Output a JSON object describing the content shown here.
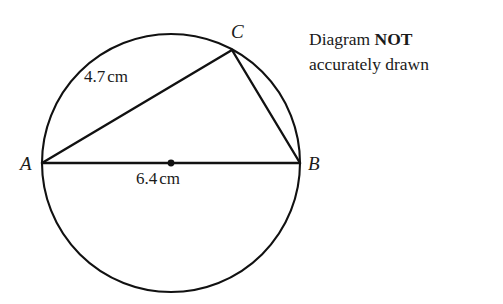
{
  "figure": {
    "background_color": "#ffffff",
    "stroke_color": "#111111",
    "circle": {
      "center_x": 171,
      "center_y": 163,
      "radius": 129,
      "centre_dot_radius": 3.4
    },
    "points": {
      "A": {
        "label": "A",
        "x": 42,
        "y": 163
      },
      "B": {
        "label": "B",
        "x": 300,
        "y": 163
      },
      "C": {
        "label": "C",
        "x": 232,
        "y": 50
      }
    },
    "segments": [
      {
        "name": "diameter-AB",
        "from": "A",
        "to": "B"
      },
      {
        "name": "chord-AC",
        "from": "A",
        "to": "C"
      },
      {
        "name": "chord-CB",
        "from": "C",
        "to": "B"
      }
    ],
    "measurements": {
      "AC": {
        "value": "4.7",
        "unit": "cm"
      },
      "AB": {
        "value": "6.4",
        "unit": "cm"
      }
    }
  },
  "note": {
    "line1_prefix": "Diagram ",
    "line1_emphasis": "NOT",
    "line2": "accurately drawn"
  }
}
